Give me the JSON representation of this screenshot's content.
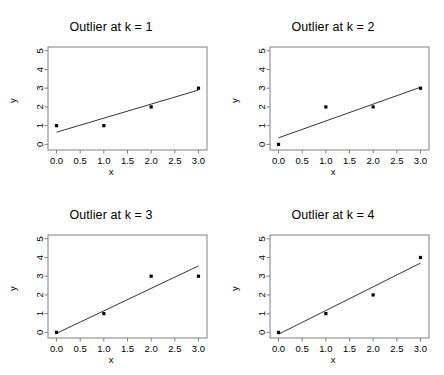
{
  "figure": {
    "layout": "2x2 grid of scatter plots with fitted regression lines",
    "background_color": "#ffffff",
    "foreground_color": "#000000",
    "point_color": "#000000",
    "line_color": "#000000",
    "frame_color": "#808080"
  },
  "panels": [
    {
      "title": "Outlier at k = 1",
      "xlabel": "x",
      "ylabel": "y"
    },
    {
      "title": "Outlier at k = 2",
      "xlabel": "x",
      "ylabel": "y"
    },
    {
      "title": "Outlier at k = 3",
      "xlabel": "x",
      "ylabel": "y"
    },
    {
      "title": "Outlier at k = 4",
      "xlabel": "x",
      "ylabel": "y"
    }
  ],
  "chart_data": [
    {
      "type": "scatter",
      "title": "Outlier at k = 1",
      "xlabel": "x",
      "ylabel": "y",
      "xlim": [
        -0.18,
        3.18
      ],
      "ylim": [
        -0.3,
        5.2
      ],
      "xticks": [
        0.0,
        0.5,
        1.0,
        1.5,
        2.0,
        2.5,
        3.0
      ],
      "xticklabels": [
        "0.0",
        "0.5",
        "1.0",
        "1.5",
        "2.0",
        "2.5",
        "3.0"
      ],
      "yticks": [
        0,
        1,
        2,
        3,
        4,
        5
      ],
      "yticklabels": [
        "0",
        "1",
        "2",
        "3",
        "4",
        "5"
      ],
      "grid": false,
      "legend": null,
      "x": [
        0,
        1,
        2,
        3
      ],
      "y": [
        1,
        1,
        2,
        3
      ],
      "fit_line": {
        "intercept": 0.65,
        "slope": 0.75,
        "x_start": 0.0,
        "x_end": 3.0,
        "y_start": 0.65,
        "y_end": 2.9
      }
    },
    {
      "type": "scatter",
      "title": "Outlier at k = 2",
      "xlabel": "x",
      "ylabel": "y",
      "xlim": [
        -0.18,
        3.18
      ],
      "ylim": [
        -0.3,
        5.2
      ],
      "xticks": [
        0.0,
        0.5,
        1.0,
        1.5,
        2.0,
        2.5,
        3.0
      ],
      "xticklabels": [
        "0.0",
        "0.5",
        "1.0",
        "1.5",
        "2.0",
        "2.5",
        "3.0"
      ],
      "yticks": [
        0,
        1,
        2,
        3,
        4,
        5
      ],
      "yticklabels": [
        "0",
        "1",
        "2",
        "3",
        "4",
        "5"
      ],
      "grid": false,
      "legend": null,
      "x": [
        0,
        1,
        2,
        3
      ],
      "y": [
        0,
        2,
        2,
        3
      ],
      "fit_line": {
        "intercept": 0.35,
        "slope": 0.9,
        "x_start": 0.0,
        "x_end": 3.0,
        "y_start": 0.35,
        "y_end": 3.05
      }
    },
    {
      "type": "scatter",
      "title": "Outlier at k = 3",
      "xlabel": "x",
      "ylabel": "y",
      "xlim": [
        -0.18,
        3.18
      ],
      "ylim": [
        -0.3,
        5.2
      ],
      "xticks": [
        0.0,
        0.5,
        1.0,
        1.5,
        2.0,
        2.5,
        3.0
      ],
      "xticklabels": [
        "0.0",
        "0.5",
        "1.0",
        "1.5",
        "2.0",
        "2.5",
        "3.0"
      ],
      "yticks": [
        0,
        1,
        2,
        3,
        4,
        5
      ],
      "yticklabels": [
        "0",
        "1",
        "2",
        "3",
        "4",
        "5"
      ],
      "grid": false,
      "legend": null,
      "x": [
        0,
        1,
        2,
        3
      ],
      "y": [
        0,
        1,
        3,
        3
      ],
      "fit_line": {
        "intercept": -0.05,
        "slope": 1.2,
        "x_start": 0.0,
        "x_end": 3.0,
        "y_start": -0.05,
        "y_end": 3.55
      }
    },
    {
      "type": "scatter",
      "title": "Outlier at k = 4",
      "xlabel": "x",
      "ylabel": "y",
      "xlim": [
        -0.18,
        3.18
      ],
      "ylim": [
        -0.3,
        5.2
      ],
      "xticks": [
        0.0,
        0.5,
        1.0,
        1.5,
        2.0,
        2.5,
        3.0
      ],
      "xticklabels": [
        "0.0",
        "0.5",
        "1.0",
        "1.5",
        "2.0",
        "2.5",
        "3.0"
      ],
      "yticks": [
        0,
        1,
        2,
        3,
        4,
        5
      ],
      "yticklabels": [
        "0",
        "1",
        "2",
        "3",
        "4",
        "5"
      ],
      "grid": false,
      "legend": null,
      "x": [
        0,
        1,
        2,
        3
      ],
      "y": [
        0,
        1,
        2,
        4
      ],
      "fit_line": {
        "intercept": -0.1,
        "slope": 1.27,
        "x_start": 0.0,
        "x_end": 3.0,
        "y_start": -0.1,
        "y_end": 3.7
      }
    }
  ]
}
